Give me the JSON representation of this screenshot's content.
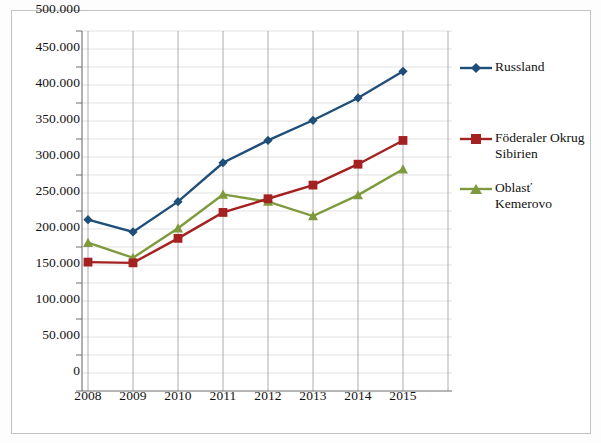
{
  "chart_data": {
    "type": "line",
    "title": "",
    "subtitle": "",
    "xlabel": "",
    "ylabel": "",
    "categories": [
      "2008",
      "2009",
      "2010",
      "2011",
      "2012",
      "2013",
      "2014",
      "2015"
    ],
    "ylim": [
      0,
      500000
    ],
    "ytick_values": [
      0,
      50000,
      100000,
      150000,
      200000,
      250000,
      300000,
      350000,
      400000,
      450000,
      500000
    ],
    "ytick_labels": [
      "0",
      "50.000",
      "100.000",
      "150.000",
      "200.000",
      "250.000",
      "300.000",
      "350.000",
      "400.000",
      "450.000",
      "500.000"
    ],
    "grid": "horizontal-and-vertical",
    "legend_position": "right",
    "minor_gridlines": true,
    "series": [
      {
        "name": "Russland",
        "color": "#1f4e79",
        "marker": "diamond",
        "values": [
          238000,
          221000,
          263000,
          317000,
          348000,
          376000,
          407000,
          444000
        ]
      },
      {
        "name": "Föderaler Okrug Sibirien",
        "color": "#a42121",
        "marker": "square",
        "values": [
          179000,
          178000,
          212000,
          248000,
          267000,
          286000,
          315000,
          348000
        ]
      },
      {
        "name": "Oblasť Kemerovo",
        "color": "#7f9a3c",
        "marker": "triangle",
        "values": [
          206000,
          185000,
          226000,
          273000,
          263000,
          243000,
          272000,
          308000
        ]
      }
    ]
  },
  "legend": {
    "entries": [
      {
        "label": "Russland"
      },
      {
        "label": "Föderaler Okrug\nSibirien"
      },
      {
        "label": "Oblasť Kemerovo"
      }
    ]
  },
  "colors": {
    "series_russland": "#1f4e79",
    "series_sibirien": "#a42121",
    "series_kemerovo": "#7f9a3c",
    "grid": "#d0d0d0",
    "axis": "#808080",
    "frame": "#bfc3c6",
    "text": "#111111"
  }
}
